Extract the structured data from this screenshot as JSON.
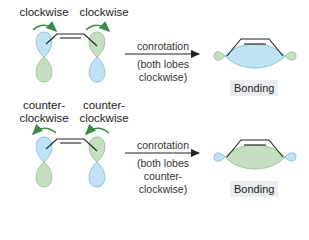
{
  "colors": {
    "blue_lobe": "#bfe3f5",
    "blue_lobe_stroke": "#7fb7d8",
    "green_lobe": "#c6dfc2",
    "green_lobe_stroke": "#8fb98a",
    "arrow_green": "#3a8a48",
    "bond_label_bg": "#e9eef0"
  },
  "top": {
    "left_label": "clockwise",
    "right_label": "clockwise",
    "arrow_label": "conrotation",
    "arrow_sub_1": "(both lobes",
    "arrow_sub_2": "clockwise)",
    "result_label": "Bonding",
    "result_lobe_color": "blue"
  },
  "bottom": {
    "left_label_1": "counter-",
    "left_label_2": "clockwise",
    "right_label_1": "counter-",
    "right_label_2": "clockwise",
    "arrow_label": "conrotation",
    "arrow_sub_1": "(both lobes",
    "arrow_sub_2": "counter-",
    "arrow_sub_3": "clockwise)",
    "result_label": "Bonding",
    "result_lobe_color": "green"
  }
}
